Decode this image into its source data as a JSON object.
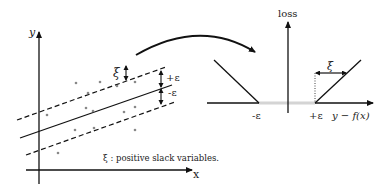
{
  "left_plot": {
    "y_axis_label": "y",
    "x_axis_label": "x",
    "xi_label": "ξ",
    "plus_eps_label": "+ε",
    "minus_eps_label": "-ε",
    "caption": "ξ : positive slack variables."
  },
  "right_plot": {
    "y_axis_label": "loss",
    "x_axis_label": "y − f(x)",
    "minus_eps_label": "-ε",
    "plus_eps_label": "+ε",
    "xi_label": "ξ"
  },
  "colors": {
    "ink": "#111111",
    "insensitive_zone": "#d4d4d4",
    "points": "#888888"
  }
}
